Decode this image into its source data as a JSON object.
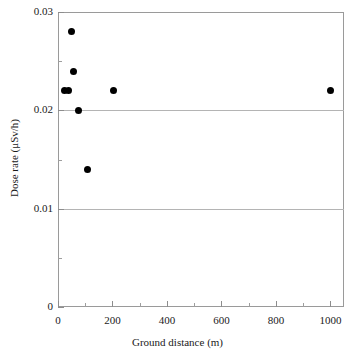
{
  "chart_data": {
    "type": "scatter",
    "title": "",
    "xlabel": "Ground distance (m)",
    "ylabel": "Dose rate (μSv/h)",
    "xlim": [
      0,
      1050
    ],
    "ylim": [
      0,
      0.03
    ],
    "grid": "horizontal gridlines at 0.01 and 0.02",
    "legend": "none",
    "x_ticks": [
      {
        "value": 0,
        "label": "0"
      },
      {
        "value": 200,
        "label": "200"
      },
      {
        "value": 400,
        "label": "400"
      },
      {
        "value": 600,
        "label": "600"
      },
      {
        "value": 800,
        "label": "800"
      },
      {
        "value": 1000,
        "label": "1000"
      }
    ],
    "x_minor_ticks": [
      100,
      300,
      500,
      700,
      900
    ],
    "y_ticks": [
      {
        "value": 0,
        "label": "0"
      },
      {
        "value": 0.01,
        "label": "0.01"
      },
      {
        "value": 0.02,
        "label": "0.02"
      },
      {
        "value": 0.03,
        "label": "0.03"
      }
    ],
    "y_minor_ticks": [
      0.005,
      0.015,
      0.025
    ],
    "gridline_values": [
      0.01,
      0.02
    ],
    "marker": {
      "shape": "circle",
      "color": "#000000",
      "size": 7
    },
    "points": [
      {
        "x": 25,
        "y": 0.022
      },
      {
        "x": 38,
        "y": 0.022
      },
      {
        "x": 50,
        "y": 0.028
      },
      {
        "x": 57,
        "y": 0.024
      },
      {
        "x": 75,
        "y": 0.02
      },
      {
        "x": 110,
        "y": 0.014
      },
      {
        "x": 205,
        "y": 0.022
      },
      {
        "x": 1000,
        "y": 0.022
      }
    ]
  },
  "colors": {
    "marker": "#000000",
    "frame": "#9a9a9a",
    "gridline": "#b4b4b4",
    "text": "#1a1a1a",
    "background": "#ffffff"
  }
}
